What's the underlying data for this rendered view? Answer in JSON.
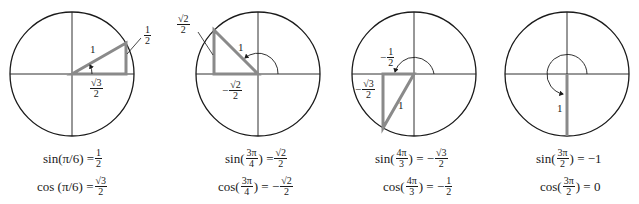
{
  "colors": {
    "circle": "#1a1a1a",
    "axis": "#1a1a1a",
    "triangle": "#8a8a8a",
    "background": "#ffffff"
  },
  "panels": [
    {
      "angle": "π/6",
      "center": [
        72,
        74
      ],
      "radius": 62,
      "hyp_label": "1",
      "opp_label": {
        "sign": "",
        "num": "1",
        "den": "2"
      },
      "adj_label": {
        "sign": "",
        "num": "√3",
        "den": "2"
      },
      "sin_eq": {
        "fn": "sin(π/6) =",
        "sign": "",
        "num": "1",
        "den": "2"
      },
      "cos_eq": {
        "fn": "cos (π/6) =",
        "sign": "",
        "num": "√3",
        "den": "2"
      }
    },
    {
      "angle": "3π/4",
      "center": [
        258,
        74
      ],
      "radius": 62,
      "hyp_label": "1",
      "opp_label": {
        "sign": "",
        "num": "√2",
        "den": "2"
      },
      "adj_label": {
        "sign": "−",
        "num": "√2",
        "den": "2"
      },
      "sin_eq": {
        "fn": "sin(",
        "arg_num": "3π",
        "arg_den": "4",
        "close": ") =",
        "sign": "",
        "num": "√2",
        "den": "2"
      },
      "cos_eq": {
        "fn": "cos(",
        "arg_num": "3π",
        "arg_den": "4",
        "close": ") =",
        "sign": "−",
        "num": "√2",
        "den": "2"
      }
    },
    {
      "angle": "4π/3",
      "center": [
        414,
        74
      ],
      "radius": 62,
      "hyp_label": "1",
      "opp_label": {
        "sign": "−",
        "num": "√3",
        "den": "2"
      },
      "adj_label": {
        "sign": "−",
        "num": "1",
        "den": "2"
      },
      "sin_eq": {
        "fn": "sin(",
        "arg_num": "4π",
        "arg_den": "3",
        "close": ") =",
        "sign": "−",
        "num": "√3",
        "den": "2"
      },
      "cos_eq": {
        "fn": "cos(",
        "arg_num": "4π",
        "arg_den": "3",
        "close": ") =",
        "sign": "−",
        "num": "1",
        "den": "2"
      }
    },
    {
      "angle": "3π/2",
      "center": [
        567,
        74
      ],
      "radius": 62,
      "hyp_label": "1",
      "sin_eq": {
        "fn": "sin(",
        "arg_num": "3π",
        "arg_den": "2",
        "close": ") =",
        "value": "−1"
      },
      "cos_eq": {
        "fn": "cos(",
        "arg_num": "3π",
        "arg_den": "2",
        "close": ") =",
        "value": "0"
      }
    }
  ]
}
